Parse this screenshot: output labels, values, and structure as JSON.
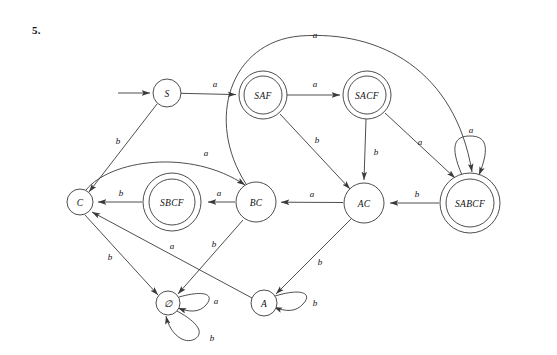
{
  "problem": {
    "number": "5."
  },
  "diagram": {
    "type": "finite-state-automaton",
    "title": "",
    "colors": {
      "stroke": "#3a3a3a",
      "text": "#111111",
      "background": "#ffffff"
    },
    "alphabet": [
      "a",
      "b"
    ],
    "start_state": "S",
    "accepting_states": [
      "SAF",
      "SACF",
      "SABCF",
      "SBCF"
    ],
    "states": [
      {
        "id": "S",
        "label": "S",
        "x": 167,
        "y": 93,
        "r": 14,
        "accepting": false
      },
      {
        "id": "SAF",
        "label": "SAF",
        "x": 263,
        "y": 95,
        "r": 24,
        "accepting": true
      },
      {
        "id": "SACF",
        "label": "SACF",
        "x": 367,
        "y": 95,
        "r": 24,
        "accepting": true
      },
      {
        "id": "SABCF",
        "label": "SABCF",
        "x": 470,
        "y": 203,
        "r": 30,
        "accepting": true
      },
      {
        "id": "C",
        "label": "C",
        "x": 80,
        "y": 202,
        "r": 13,
        "accepting": false
      },
      {
        "id": "SBCF",
        "label": "SBCF",
        "x": 172,
        "y": 202,
        "r": 29,
        "accepting": true
      },
      {
        "id": "BC",
        "label": "BC",
        "x": 256,
        "y": 202,
        "r": 20,
        "accepting": false
      },
      {
        "id": "AC",
        "label": "AC",
        "x": 364,
        "y": 203,
        "r": 20,
        "accepting": false
      },
      {
        "id": "EMPTY",
        "label": "∅",
        "x": 168,
        "y": 303,
        "r": 12,
        "accepting": false
      },
      {
        "id": "A",
        "label": "A",
        "x": 264,
        "y": 303,
        "r": 13,
        "accepting": false
      }
    ],
    "transitions": [
      {
        "from": "S",
        "to": "SAF",
        "symbol": "a",
        "label_x": 215,
        "label_y": 84
      },
      {
        "from": "S",
        "to": "C",
        "symbol": "b",
        "label_x": 118,
        "label_y": 141
      },
      {
        "from": "SAF",
        "to": "SACF",
        "symbol": "a",
        "label_x": 315,
        "label_y": 84
      },
      {
        "from": "SAF",
        "to": "AC",
        "symbol": "b",
        "label_x": 317,
        "label_y": 140
      },
      {
        "from": "SACF",
        "to": "AC",
        "symbol": "b",
        "label_x": 376,
        "label_y": 152
      },
      {
        "from": "SACF",
        "to": "SABCF",
        "symbol": "a",
        "label_x": 420,
        "label_y": 142
      },
      {
        "from": "SABCF",
        "to": "SABCF",
        "symbol": "a",
        "label_x": 471,
        "label_y": 130
      },
      {
        "from": "SABCF",
        "to": "AC",
        "symbol": "b",
        "label_x": 417,
        "label_y": 194
      },
      {
        "from": "AC",
        "to": "BC",
        "symbol": "a",
        "label_x": 312,
        "label_y": 194
      },
      {
        "from": "AC",
        "to": "A",
        "symbol": "b",
        "label_x": 320,
        "label_y": 262
      },
      {
        "from": "BC",
        "to": "SBCF",
        "symbol": "a",
        "label_x": 219,
        "label_y": 193
      },
      {
        "from": "BC",
        "to": "EMPTY",
        "symbol": "b",
        "label_x": 214,
        "label_y": 244
      },
      {
        "from": "BC",
        "to": "SABCF",
        "symbol": "a",
        "label_x": 315,
        "label_y": 35
      },
      {
        "from": "SBCF",
        "to": "C",
        "symbol": "b",
        "label_x": 121,
        "label_y": 193
      },
      {
        "from": "C",
        "to": "BC",
        "symbol": "a",
        "label_x": 206,
        "label_y": 153
      },
      {
        "from": "C",
        "to": "EMPTY",
        "symbol": "b",
        "label_x": 110,
        "label_y": 257
      },
      {
        "from": "A",
        "to": "C",
        "symbol": "a",
        "label_x": 172,
        "label_y": 246
      },
      {
        "from": "A",
        "to": "A",
        "symbol": "b",
        "label_x": 315,
        "label_y": 303
      },
      {
        "from": "EMPTY",
        "to": "EMPTY",
        "symbol": "a",
        "label_x": 216,
        "label_y": 301
      },
      {
        "from": "EMPTY",
        "to": "EMPTY",
        "symbol": "b",
        "label_x": 212,
        "label_y": 338
      }
    ]
  }
}
